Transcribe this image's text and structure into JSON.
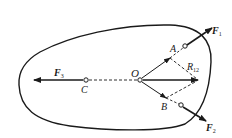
{
  "diagram": {
    "type": "rigid body force diagram",
    "colors": {
      "stroke": "#1a1a1a",
      "background": "#ffffff"
    },
    "points": {
      "O": {
        "label": "O",
        "x": 140,
        "y": 80
      },
      "A": {
        "label": "A",
        "x": 170,
        "y": 58
      },
      "B": {
        "label": "B",
        "x": 166,
        "y": 98
      },
      "C": {
        "label": "C",
        "x": 86,
        "y": 80
      }
    },
    "forces": {
      "F1": {
        "label": "F",
        "sub": "1"
      },
      "F2": {
        "label": "F",
        "sub": "2"
      },
      "F3": {
        "label": "F",
        "sub": "3"
      },
      "R12": {
        "label": "R",
        "sub": "12"
      }
    }
  }
}
